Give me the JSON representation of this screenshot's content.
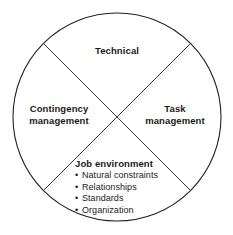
{
  "diagram": {
    "type": "circle-quadrant-model",
    "shape": {
      "outline": "circle",
      "divider": "diagonal-cross",
      "stroke_color": "#231f20",
      "stroke_width": 1,
      "fill_color": "#ffffff",
      "background_color": "#ffffff",
      "center_x": 117,
      "center_y": 117,
      "radius": 104
    },
    "quadrants": {
      "top": {
        "name": "technical",
        "label": "Technical"
      },
      "left": {
        "name": "contingency-management",
        "label": "Contingency\nmanagement"
      },
      "right": {
        "name": "task-management",
        "label": "Task\nmanagement"
      },
      "bottom": {
        "name": "job-environment",
        "heading": "Job environment",
        "bullet_glyph": "•",
        "items": [
          "Natural constraints",
          "Relationships",
          "Standards",
          "Organization"
        ]
      }
    }
  }
}
